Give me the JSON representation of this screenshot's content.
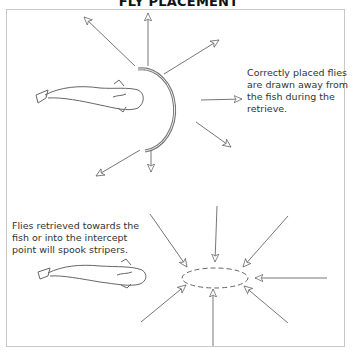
{
  "title": "FLY PLACEMENT",
  "top_diagram": {
    "caption": "Correctly placed flies are drawn away from the fish during the retrieve."
  },
  "bottom_diagram": {
    "caption": "Flies retrieved towards the fish or into the intercept point will spook stripers."
  },
  "colors": {
    "line": "#6a6a6a",
    "frame": "#c8c8c8",
    "text": "#333333"
  }
}
